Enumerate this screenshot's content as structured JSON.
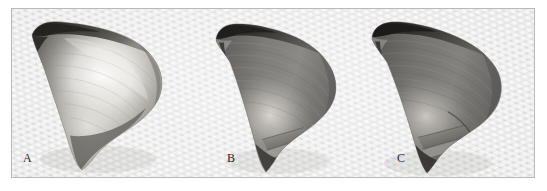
{
  "figure": {
    "background_color": "#d2d2d2",
    "border_color": "#b9b9b9",
    "panel_count": 3,
    "panels": [
      {
        "label": "A",
        "description": "3D rendered anatomical surface model, bright specular highlight on central region, dark ridge along superior margin",
        "shading": "light",
        "highlight_color": "#f6f4f0",
        "midtone_color": "#9a9894",
        "shadow_color": "#3a3836"
      },
      {
        "label": "B",
        "description": "3D rendered anatomical surface model, uniformly darker shading with faint central highlight and stepped inferior contour edge",
        "shading": "medium",
        "highlight_color": "#cfccc6",
        "midtone_color": "#7c7a76",
        "shadow_color": "#302e2c"
      },
      {
        "label": "C",
        "description": "3D rendered anatomical surface model, darkest shading, faint central highlight, stepped inferior contour edge",
        "shading": "dark",
        "highlight_color": "#c6c3bd",
        "midtone_color": "#747270",
        "shadow_color": "#2c2a28"
      }
    ]
  }
}
